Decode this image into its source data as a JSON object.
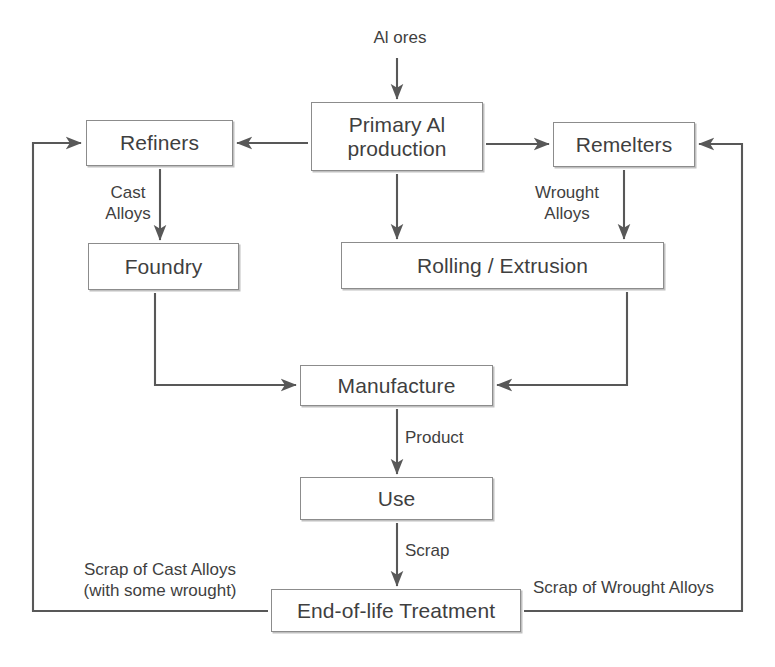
{
  "diagram": {
    "canvas": {
      "width": 775,
      "height": 667
    },
    "colors": {
      "background": "#ffffff",
      "box_border": "#8c8c8c",
      "box_fill": "#ffffff",
      "text": "#3f3f3f",
      "arrow": "#585858"
    },
    "nodes": [
      {
        "id": "primary",
        "label": "Primary Al\nproduction",
        "x": 311,
        "y": 102,
        "w": 172,
        "h": 69
      },
      {
        "id": "refiners",
        "label": "Refiners",
        "x": 86,
        "y": 120,
        "w": 147,
        "h": 46
      },
      {
        "id": "remelters",
        "label": "Remelters",
        "x": 553,
        "y": 122,
        "w": 142,
        "h": 45
      },
      {
        "id": "foundry",
        "label": "Foundry",
        "x": 88,
        "y": 243,
        "w": 151,
        "h": 47
      },
      {
        "id": "rolling",
        "label": "Rolling / Extrusion",
        "x": 341,
        "y": 242,
        "w": 323,
        "h": 47
      },
      {
        "id": "manufacture",
        "label": "Manufacture",
        "x": 300,
        "y": 365,
        "w": 193,
        "h": 41
      },
      {
        "id": "use",
        "label": "Use",
        "x": 300,
        "y": 477,
        "w": 193,
        "h": 43
      },
      {
        "id": "eol",
        "label": "End-of-life Treatment",
        "x": 271,
        "y": 589,
        "w": 250,
        "h": 43
      }
    ],
    "edge_labels": [
      {
        "id": "al-ores",
        "text": "Al ores",
        "x": 355,
        "y": 28,
        "w": 90,
        "align": "center"
      },
      {
        "id": "cast-alloys",
        "text": "Cast\nAlloys",
        "x": 88,
        "y": 183,
        "w": 80,
        "align": "center"
      },
      {
        "id": "wrought-alloys",
        "text": "Wrought\nAlloys",
        "x": 512,
        "y": 183,
        "w": 110,
        "align": "center"
      },
      {
        "id": "product",
        "text": "Product",
        "x": 405,
        "y": 428,
        "w": 90,
        "align": "left"
      },
      {
        "id": "scrap",
        "text": "Scrap",
        "x": 405,
        "y": 541,
        "w": 80,
        "align": "left"
      },
      {
        "id": "scrap-cast",
        "text": "Scrap of Cast Alloys\n(with some wrought)",
        "x": 55,
        "y": 560,
        "w": 210,
        "align": "center"
      },
      {
        "id": "scrap-wrought",
        "text": "Scrap of Wrought Alloys",
        "x": 533,
        "y": 578,
        "w": 210,
        "align": "left"
      }
    ],
    "edges": [
      {
        "id": "ores-to-primary",
        "from": "Al ores",
        "to": "Primary Al production"
      },
      {
        "id": "primary-to-refiners",
        "from": "Primary Al production",
        "to": "Refiners"
      },
      {
        "id": "primary-to-remelters",
        "from": "Primary Al production",
        "to": "Remelters"
      },
      {
        "id": "primary-to-rolling",
        "from": "Primary Al production",
        "to": "Rolling / Extrusion"
      },
      {
        "id": "refiners-to-foundry",
        "from": "Refiners",
        "to": "Foundry"
      },
      {
        "id": "remelters-to-rolling",
        "from": "Remelters",
        "to": "Rolling / Extrusion"
      },
      {
        "id": "foundry-to-manufacture",
        "from": "Foundry",
        "to": "Manufacture"
      },
      {
        "id": "rolling-to-manufacture",
        "from": "Rolling / Extrusion",
        "to": "Manufacture"
      },
      {
        "id": "manufacture-to-use",
        "from": "Manufacture",
        "to": "Use"
      },
      {
        "id": "use-to-eol",
        "from": "Use",
        "to": "End-of-life Treatment"
      },
      {
        "id": "eol-to-refiners",
        "from": "End-of-life Treatment",
        "to": "Refiners"
      },
      {
        "id": "eol-to-remelters",
        "from": "End-of-life Treatment",
        "to": "Remelters"
      }
    ]
  }
}
